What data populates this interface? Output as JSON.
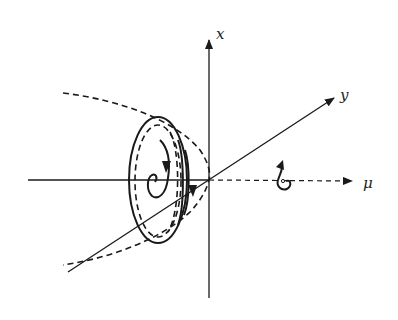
{
  "diagram": {
    "type": "bifurcation-phase-portrait",
    "axes": {
      "vertical": {
        "label": "x"
      },
      "diagonal": {
        "label": "y"
      },
      "horizontal": {
        "label": "μ"
      }
    },
    "elements": [
      "dashed parabola of unstable limit cycles opening toward negative μ",
      "nested elliptical limit cycles (solid and dashed) near negative μ",
      "inward spiral trajectory with downward arrows",
      "small outward spiral with arrow at positive μ on dashed μ-axis"
    ],
    "colors": {
      "ink": "#1a1a1a",
      "background": "#ffffff"
    }
  }
}
